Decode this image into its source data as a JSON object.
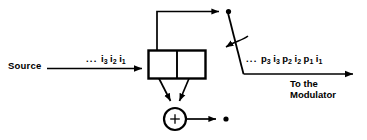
{
  "figure": {
    "background_color": "#ffffff",
    "line_color": "#000000"
  },
  "labels": {
    "source": "Source",
    "destination_line1": "To the",
    "destination_line2": "Modulator",
    "adder_symbol": "+",
    "ellipsis": "..."
  },
  "input_sequence": {
    "ellipsis": "...",
    "terms": [
      {
        "base": "i",
        "sub": "3"
      },
      {
        "base": "i",
        "sub": "2"
      },
      {
        "base": "i",
        "sub": "1"
      }
    ]
  },
  "output_sequence": {
    "ellipsis": "...",
    "terms": [
      {
        "base": "p",
        "sub": "3"
      },
      {
        "base": "i",
        "sub": "3"
      },
      {
        "base": "p",
        "sub": "2"
      },
      {
        "base": "i",
        "sub": "2"
      },
      {
        "base": "p",
        "sub": "1"
      },
      {
        "base": "i",
        "sub": "1"
      }
    ]
  },
  "components": {
    "shift_register": {
      "name": "two-stage shift register",
      "cells": 2
    },
    "adder": {
      "name": "modulo-2 adder",
      "symbol": "+"
    },
    "switch": {
      "name": "commutator switch",
      "contacts": 2,
      "rotation_indicated": true
    }
  }
}
